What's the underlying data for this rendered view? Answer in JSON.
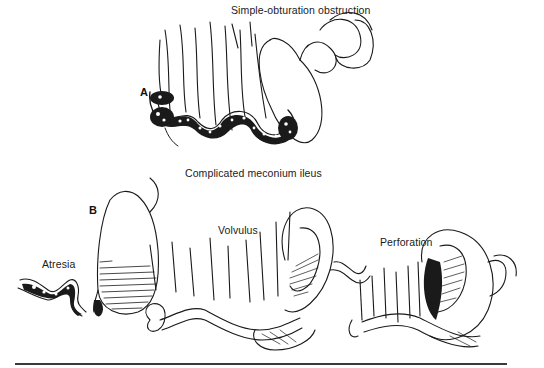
{
  "figure": {
    "panel_a": {
      "letter": "A",
      "title": "Simple-obturation obstruction"
    },
    "panel_b": {
      "letter": "B",
      "title": "Complicated meconium ileus",
      "sub_labels": {
        "atresia": "Atresia",
        "volvulus": "Volvulus",
        "perforation": "Perforation"
      }
    }
  }
}
